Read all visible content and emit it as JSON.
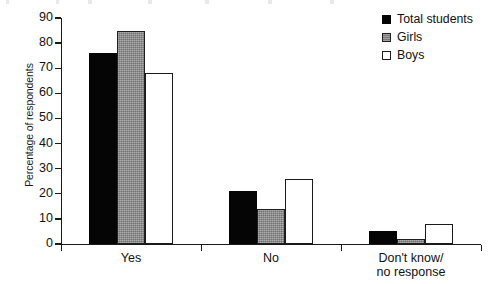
{
  "chart_data": {
    "type": "bar",
    "title": "",
    "subtitle": "",
    "xlabel": "",
    "ylabel": "Percentage of respondents",
    "categories": [
      "Yes",
      "No",
      "Don't know/\nno response"
    ],
    "series": [
      {
        "name": "Total students",
        "color": "#050505",
        "values": [
          76,
          21,
          5
        ]
      },
      {
        "name": "Girls",
        "color": "#8a8a8a",
        "values": [
          85,
          14,
          2
        ]
      },
      {
        "name": "Boys",
        "color": "#ffffff",
        "values": [
          68,
          26,
          8
        ]
      }
    ],
    "ylim": [
      0,
      90
    ],
    "yticks": [
      0,
      10,
      20,
      30,
      40,
      50,
      60,
      70,
      80,
      90
    ],
    "ytick_labels": [
      "0",
      "10",
      "20",
      "30",
      "40",
      "50",
      "60",
      "70",
      "80",
      "90"
    ],
    "grid": false,
    "legend_position": "top-right"
  },
  "legend": {
    "items": [
      {
        "label": "Total students",
        "swatch": "total"
      },
      {
        "label": "Girls",
        "swatch": "girls"
      },
      {
        "label": "Boys",
        "swatch": "boys"
      }
    ]
  }
}
